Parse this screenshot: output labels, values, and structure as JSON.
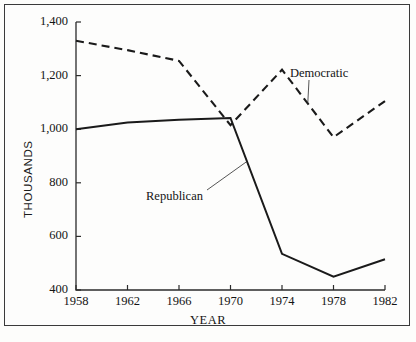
{
  "chart_data": {
    "type": "line",
    "title": "",
    "xlabel": "YEAR",
    "ylabel": "THOUSANDS",
    "x": [
      1958,
      1962,
      1966,
      1970,
      1974,
      1978,
      1982
    ],
    "xtick_labels": [
      "1958",
      "1962",
      "1966",
      "1970",
      "1974",
      "1978",
      "1982"
    ],
    "ytick_labels": [
      "400",
      "600",
      "800",
      "1,000",
      "1,200",
      "1,400"
    ],
    "yticks": [
      400,
      600,
      800,
      1000,
      1200,
      1400
    ],
    "ylim": [
      400,
      1400
    ],
    "xlim": [
      1958,
      1982
    ],
    "grid": false,
    "legend_position": "inline-annotation",
    "series": [
      {
        "name": "Democratic",
        "style": "dashed",
        "color": "#1a1a1a",
        "values": [
          1330,
          1295,
          1255,
          1015,
          1222,
          970,
          1105
        ]
      },
      {
        "name": "Republican",
        "style": "solid",
        "color": "#1a1a1a",
        "values": [
          1000,
          1025,
          1035,
          1042,
          535,
          450,
          515
        ]
      }
    ],
    "annotations": [
      {
        "text": "Democratic",
        "series": "Democratic",
        "points_to_year": 1976
      },
      {
        "text": "Republican",
        "series": "Republican",
        "points_to_year": 1971
      }
    ]
  },
  "axis": {
    "y_title": "THOUSANDS",
    "x_title": "YEAR"
  },
  "caption": {
    "ghost_text": ""
  }
}
